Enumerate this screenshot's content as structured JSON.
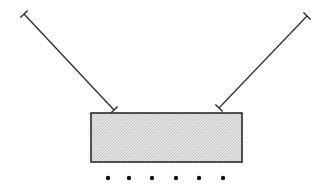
{
  "diagram": {
    "colors": {
      "stroke": "#2a2a2a",
      "fill": "#d9d9d9",
      "dot": "#111111",
      "background": "#ffffff"
    },
    "lines": [
      {
        "name": "left-line",
        "x1": 24,
        "y1": 14,
        "x2": 114,
        "y2": 110
      },
      {
        "name": "right-line",
        "x1": 307,
        "y1": 16,
        "x2": 219,
        "y2": 108
      }
    ],
    "rectangle": {
      "x": 91,
      "y": 113,
      "width": 151,
      "height": 49
    },
    "dots": [
      {
        "cx": 108,
        "cy": 178
      },
      {
        "cx": 129,
        "cy": 178
      },
      {
        "cx": 152,
        "cy": 178
      },
      {
        "cx": 176,
        "cy": 178
      },
      {
        "cx": 199,
        "cy": 178
      },
      {
        "cx": 223,
        "cy": 178
      }
    ]
  }
}
